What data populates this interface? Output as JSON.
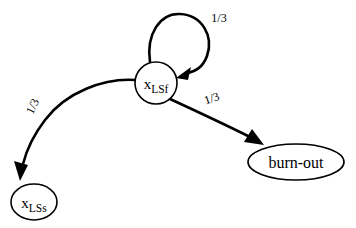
{
  "figure": {
    "kind": "state-transition-diagram",
    "background_color": "#ffffff",
    "stroke_color": "#000000",
    "width": 356,
    "height": 228
  },
  "nodes": {
    "lsf": {
      "id": "x_LSf",
      "shape": "circle",
      "variable": "x",
      "subscript": "LSf",
      "cx": 156,
      "cy": 83,
      "r": 21
    },
    "lss": {
      "id": "x_LSs",
      "shape": "ellipse",
      "variable": "x",
      "subscript": "LSs",
      "cx": 34,
      "cy": 202,
      "rx": 23,
      "ry": 18
    },
    "burnout": {
      "id": "burn-out",
      "shape": "ellipse",
      "label": "burn-out",
      "cx": 296,
      "cy": 162,
      "rx": 48,
      "ry": 18
    }
  },
  "edges": {
    "self_loop": {
      "from": "x_LSf",
      "to": "x_LSf",
      "label": "1/3",
      "label_x": 219,
      "label_y": 22
    },
    "to_lss": {
      "from": "x_LSf",
      "to": "x_LSs",
      "label": "1/3",
      "label_x": 36,
      "label_y": 108,
      "label_rotation": -64
    },
    "to_burnout": {
      "from": "x_LSf",
      "to": "burn-out",
      "label": "1/3",
      "label_x": 213,
      "label_y": 102,
      "label_rotation": -19
    }
  }
}
